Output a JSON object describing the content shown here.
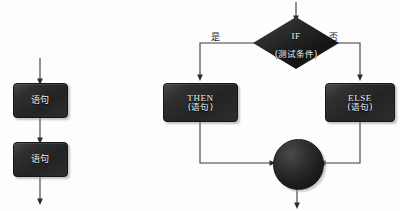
{
  "diagram": {
    "colors": {
      "node_fill": "#2b2b2b",
      "node_text": "#f2f2f2",
      "line": "#3a3a3a",
      "background": "#fdfdfd"
    },
    "sequence_column": {
      "nodes": [
        {
          "id": "stmt-1",
          "label": "语句"
        },
        {
          "id": "stmt-2",
          "label": "语句"
        }
      ]
    },
    "branch_structure": {
      "decision": {
        "id": "if-decision",
        "line1": "IF",
        "line2": "(测试条件)"
      },
      "edge_labels": {
        "yes": "是",
        "no": "否"
      },
      "branches": [
        {
          "id": "then-branch",
          "line1": "THEN",
          "line2": "(语句)"
        },
        {
          "id": "else-branch",
          "line1": "ELSE",
          "line2": "(语句)"
        }
      ],
      "merge": {
        "id": "merge-node",
        "label": ""
      }
    }
  }
}
